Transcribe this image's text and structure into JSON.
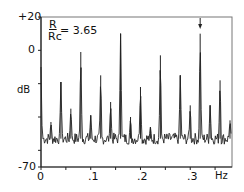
{
  "chart_data": {
    "type": "line",
    "title": "",
    "annotation": "R/Rc = 3.65",
    "annotation_num": "R",
    "annotation_den": "Rc",
    "annotation_val": "= 3.65",
    "xlabel": "Hz",
    "ylabel": "dB",
    "xlim": [
      0,
      0.384
    ],
    "ylim": [
      -70,
      20
    ],
    "xticks": [
      "0",
      ".1",
      ".2",
      ".3"
    ],
    "yticks": [
      "+20",
      "0",
      "-70"
    ],
    "grid": false,
    "noise_floor_db": -53,
    "peaks": [
      {
        "x": 0.02,
        "y": -43
      },
      {
        "x": 0.04,
        "y": -19
      },
      {
        "x": 0.06,
        "y": -35
      },
      {
        "x": 0.08,
        "y": -1
      },
      {
        "x": 0.1,
        "y": -39
      },
      {
        "x": 0.12,
        "y": -15
      },
      {
        "x": 0.14,
        "y": -31
      },
      {
        "x": 0.16,
        "y": 10
      },
      {
        "x": 0.18,
        "y": -40
      },
      {
        "x": 0.2,
        "y": -22
      },
      {
        "x": 0.22,
        "y": -46
      },
      {
        "x": 0.24,
        "y": -3
      },
      {
        "x": 0.28,
        "y": -15
      },
      {
        "x": 0.3,
        "y": -33
      },
      {
        "x": 0.32,
        "y": 10
      },
      {
        "x": 0.34,
        "y": -33
      },
      {
        "x": 0.36,
        "y": -18
      },
      {
        "x": 0.38,
        "y": -42
      }
    ],
    "arrow_at": 0.32
  }
}
